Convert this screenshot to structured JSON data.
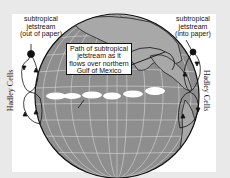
{
  "labels": {
    "left_jetstream": [
      "subtropical",
      "jetstream",
      "(out of paper)"
    ],
    "right_jetstream": [
      "subtropical",
      "jetstream",
      "(into paper)"
    ],
    "callout": [
      "Path of subtropical",
      "jetstream as it",
      "flows over northern",
      "Gulf of Mexico"
    ],
    "left_cells": "Hadley Cells",
    "right_cells": "Hadley Cells"
  },
  "colors": {
    "frame": "#e9e9e9",
    "panel": "#ffffff",
    "globe": "#8e8e8e",
    "land": "#a9a9a9",
    "grid": "#d8d8d8",
    "clouds": "#ffffff",
    "ink": "#111111"
  }
}
